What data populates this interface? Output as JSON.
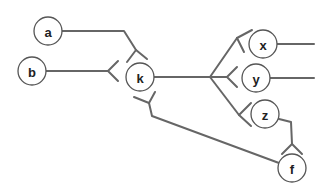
{
  "diagram": {
    "type": "entity-relationship (crow's foot notation)",
    "colors": {
      "edge": "#666666",
      "node_stroke": "#555555",
      "node_fill": "#ffffff",
      "label": "#222222"
    },
    "nodes": [
      {
        "id": "a",
        "label": "a"
      },
      {
        "id": "b",
        "label": "b"
      },
      {
        "id": "k",
        "label": "k"
      },
      {
        "id": "x",
        "label": "x"
      },
      {
        "id": "y",
        "label": "y"
      },
      {
        "id": "z",
        "label": "z"
      },
      {
        "id": "f",
        "label": "f"
      }
    ],
    "edges": [
      {
        "from": "a",
        "to": "k",
        "end": "many"
      },
      {
        "from": "b",
        "to": "k",
        "end": "many"
      },
      {
        "from": "k",
        "to": "x",
        "end": "many"
      },
      {
        "from": "k",
        "to": "y",
        "end": "many"
      },
      {
        "from": "k",
        "to": "z",
        "end": "many"
      },
      {
        "from": "f",
        "to": "k",
        "end": "many"
      },
      {
        "from": "z",
        "to": "f",
        "end": "many"
      }
    ]
  }
}
